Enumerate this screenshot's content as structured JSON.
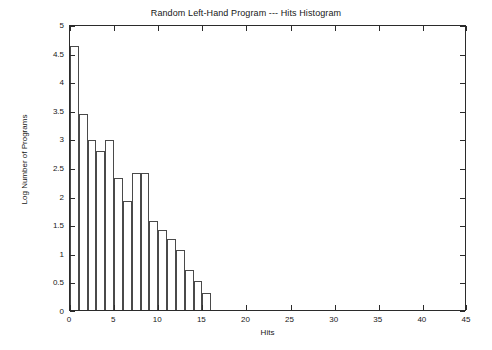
{
  "chart_data": {
    "type": "bar",
    "title": "Random Left-Hand Program --- Hits Histogram",
    "xlabel": "Hits",
    "ylabel": "Log Number of Programs",
    "xlim": [
      0,
      45
    ],
    "ylim": [
      0,
      5
    ],
    "xticks": [
      0,
      5,
      10,
      15,
      20,
      25,
      30,
      35,
      40,
      45
    ],
    "xtick_labels": [
      "0",
      "5",
      "10",
      "15",
      "20",
      "25",
      "30",
      "35",
      "40",
      "45"
    ],
    "yticks": [
      0,
      0.5,
      1,
      1.5,
      2,
      2.5,
      3,
      3.5,
      4,
      4.5,
      5
    ],
    "ytick_labels": [
      "0",
      "0.5",
      "1",
      "1.5",
      "2",
      "2.5",
      "3",
      "3.5",
      "4",
      "4.5",
      "5"
    ],
    "grid": false,
    "legend": false,
    "bar_width": 1,
    "categories": [
      0,
      1,
      2,
      3,
      4,
      5,
      6,
      7,
      8,
      9,
      10,
      11,
      12,
      13,
      14,
      15
    ],
    "values": [
      4.62,
      3.43,
      2.97,
      2.78,
      2.97,
      2.3,
      1.9,
      2.4,
      2.4,
      1.55,
      1.4,
      1.25,
      1.05,
      0.7,
      0.5,
      0.3
    ],
    "series": [
      {
        "name": "Hits Histogram",
        "values": [
          4.62,
          3.43,
          2.97,
          2.78,
          2.97,
          2.3,
          1.9,
          2.4,
          2.4,
          1.55,
          1.4,
          1.25,
          1.05,
          0.7,
          0.5,
          0.3
        ]
      }
    ],
    "bar_edge_color": "#4a4a4a",
    "bar_fill_color": "#ffffff",
    "axis_color": "#2b2b2b",
    "text_color": "#171717",
    "background_color": "#ffffff"
  }
}
